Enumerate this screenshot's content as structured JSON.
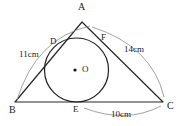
{
  "figure": {
    "stroke_color": "#262626",
    "arc_color": "#8a8a8a",
    "circle_color": "#1f1f1f",
    "background": "#ffffff"
  },
  "vertices": [
    {
      "id": "A",
      "label": "A",
      "x": 82,
      "y": 22,
      "label_x": 78,
      "label_y": 2
    },
    {
      "id": "B",
      "label": "B",
      "x": 15,
      "y": 102,
      "label_x": 9,
      "label_y": 105
    },
    {
      "id": "C",
      "label": "C",
      "x": 163,
      "y": 102,
      "label_x": 167,
      "label_y": 101
    }
  ],
  "tangent_points": [
    {
      "id": "D",
      "label": "D",
      "x": 58,
      "y": 48,
      "label_x": 50,
      "label_y": 37,
      "on_side": "AB"
    },
    {
      "id": "E",
      "label": "E",
      "x": 77,
      "y": 102,
      "label_x": 73,
      "label_y": 105,
      "on_side": "BC"
    },
    {
      "id": "F",
      "label": "F",
      "x": 103,
      "y": 44,
      "label_x": 101,
      "label_y": 33,
      "on_side": "AC"
    }
  ],
  "incircle": {
    "center_label": "O",
    "center_x": 76.5,
    "center_y": 70,
    "radius": 32,
    "center_label_x": 82,
    "center_label_y": 65,
    "center_dot_x": 75,
    "center_dot_y": 70,
    "center_dot_r": 1.6
  },
  "measurements": [
    {
      "id": "ab",
      "label": "11cm",
      "side": "AB",
      "label_x": 19,
      "label_y": 50
    },
    {
      "id": "ac",
      "label": "14cm",
      "side": "AC",
      "label_x": 124,
      "label_y": 45
    },
    {
      "id": "bc",
      "label": "10cm",
      "side": "BC",
      "label_x": 111,
      "label_y": 110
    }
  ],
  "arcs": {
    "ab_arc": "M 90 26 Q 36 38 17 100",
    "ac_arc": "M 92 27 Q 152 46 164 97",
    "bc_arc": "M 84 108 Q 126 124 161 106"
  }
}
